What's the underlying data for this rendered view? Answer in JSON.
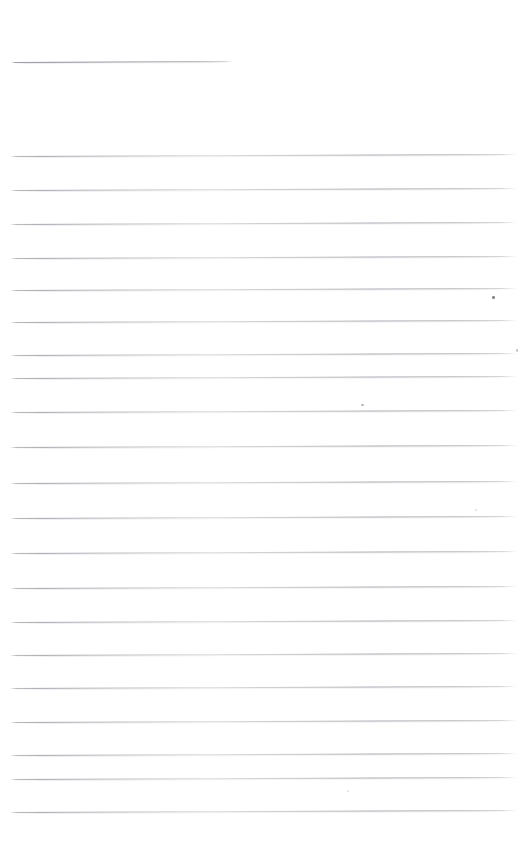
{
  "document": {
    "kind": "scanned-ruled-paper",
    "title": "Blank lined notebook page",
    "page_width": 531,
    "page_height": 853,
    "background_color": "#ffffff",
    "content_text": "",
    "visible_text_count": 0
  },
  "colors": {
    "page_background": "#ffffff",
    "rule_ink": "#9ea0a6",
    "rule_ink_dark": "#8c8e96",
    "rule_halo": "#cdcfd4",
    "speck_dark": "#6e6f74",
    "speck_light": "#c9cbd0"
  },
  "header_rule": {
    "name": "header-rule",
    "x_start": 11,
    "x_end": 233,
    "y": 62,
    "length": 222,
    "thickness": 1,
    "slant_deg": -0.26
  },
  "body_rules": {
    "count": 20,
    "x_start": 10,
    "x_end": 517,
    "length": 507,
    "first_y": 156,
    "spacing": 34.5,
    "thickness": 1,
    "slant_deg": -0.22,
    "lines": [
      {
        "index": 1,
        "y": 156,
        "x_start": 10,
        "x_end": 517
      },
      {
        "index": 2,
        "y": 190,
        "x_start": 10,
        "x_end": 517
      },
      {
        "index": 3,
        "y": 224,
        "x_start": 10,
        "x_end": 517
      },
      {
        "index": 4,
        "y": 258,
        "x_start": 10,
        "x_end": 517
      },
      {
        "index": 5,
        "y": 290,
        "x_start": 10,
        "x_end": 517
      },
      {
        "index": 6,
        "y": 322,
        "x_start": 10,
        "x_end": 517
      },
      {
        "index": 7,
        "y": 355,
        "x_start": 10,
        "x_end": 517
      },
      {
        "index": 8,
        "y": 378,
        "x_start": 10,
        "x_end": 517
      },
      {
        "index": 9,
        "y": 412,
        "x_start": 10,
        "x_end": 517
      },
      {
        "index": 10,
        "y": 447,
        "x_start": 10,
        "x_end": 517
      },
      {
        "index": 11,
        "y": 483,
        "x_start": 10,
        "x_end": 517
      },
      {
        "index": 12,
        "y": 518,
        "x_start": 10,
        "x_end": 517
      },
      {
        "index": 13,
        "y": 553,
        "x_start": 10,
        "x_end": 517
      },
      {
        "index": 14,
        "y": 588,
        "x_start": 10,
        "x_end": 517
      },
      {
        "index": 15,
        "y": 622,
        "x_start": 10,
        "x_end": 517
      },
      {
        "index": 16,
        "y": 655,
        "x_start": 10,
        "x_end": 517
      },
      {
        "index": 17,
        "y": 688,
        "x_start": 10,
        "x_end": 517
      },
      {
        "index": 18,
        "y": 722,
        "x_start": 10,
        "x_end": 517
      },
      {
        "index": 19,
        "y": 755,
        "x_start": 10,
        "x_end": 517
      },
      {
        "index": 20,
        "y": 779,
        "x_start": 10,
        "x_end": 517
      },
      {
        "index": 21,
        "y": 812,
        "x_start": 10,
        "x_end": 517
      }
    ]
  },
  "specks": [
    {
      "name": "speck-1",
      "x": 492,
      "y": 296,
      "w": 3,
      "h": 3,
      "color": "#6e6f74",
      "opacity": 0.85
    },
    {
      "name": "speck-2",
      "x": 516,
      "y": 349,
      "w": 2,
      "h": 3,
      "color": "#a8aab0",
      "opacity": 0.7
    },
    {
      "name": "speck-3",
      "x": 361,
      "y": 404,
      "w": 3,
      "h": 2,
      "color": "#9a9ca2",
      "opacity": 0.75
    },
    {
      "name": "speck-4",
      "x": 475,
      "y": 509,
      "w": 2,
      "h": 2,
      "color": "#c2c4c9",
      "opacity": 0.6
    },
    {
      "name": "speck-5",
      "x": 347,
      "y": 790,
      "w": 2,
      "h": 2,
      "color": "#c9cbd0",
      "opacity": 0.55
    }
  ]
}
